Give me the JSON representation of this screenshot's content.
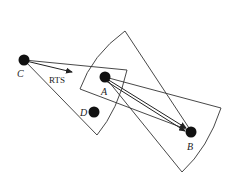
{
  "diagram": {
    "nodes": [
      {
        "id": "C",
        "label": "C",
        "x": 24,
        "y": 60
      },
      {
        "id": "A",
        "label": "A",
        "x": 105,
        "y": 77
      },
      {
        "id": "D",
        "label": "D",
        "x": 94,
        "y": 112
      },
      {
        "id": "B",
        "label": "B",
        "x": 191,
        "y": 131
      }
    ],
    "message_label": "RTS",
    "sectors": [
      {
        "apex": "C",
        "description": "antenna beam sector from C"
      },
      {
        "apex": "B",
        "description": "antenna beam sector from B"
      },
      {
        "apex": "A",
        "description": "antenna beam sector from A"
      }
    ],
    "arrows": [
      {
        "from": "C",
        "to": "RTS-direction"
      },
      {
        "from": "A",
        "to": "B"
      },
      {
        "from": "A",
        "to": "B"
      }
    ],
    "colors": {
      "node": "#111111",
      "line": "#333333",
      "background": "#ffffff"
    }
  }
}
